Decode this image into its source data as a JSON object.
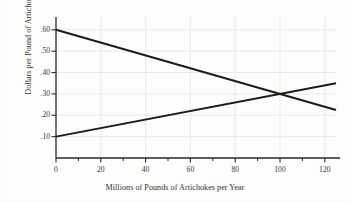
{
  "chart_data": {
    "type": "line",
    "title": "",
    "subtitle": "",
    "xlabel": "Millions of Pounds of Artichokes per Year",
    "ylabel": "Dollars per Pound of Artichokes",
    "xlim": [
      0,
      125
    ],
    "ylim": [
      0,
      0.66
    ],
    "grid": true,
    "legend_position": "none",
    "xticks": [
      0,
      20,
      40,
      60,
      80,
      100,
      120
    ],
    "xticklabels": [
      "0",
      "20",
      "40",
      "60",
      "80",
      "100",
      "120"
    ],
    "xminor_ticks": [
      10,
      30,
      50,
      70,
      90,
      110
    ],
    "yticks": [
      0.1,
      0.2,
      0.3,
      0.4,
      0.5,
      0.6
    ],
    "yticklabels": [
      ".10",
      ".20",
      ".30",
      ".40",
      ".50",
      ".60"
    ],
    "series": [
      {
        "name": "demand",
        "kind": "line",
        "x": [
          0,
          125
        ],
        "y": [
          0.6,
          0.225
        ],
        "color": "#1d1b1b",
        "width": 2.0
      },
      {
        "name": "supply",
        "kind": "line",
        "x": [
          0,
          125
        ],
        "y": [
          0.1,
          0.35
        ],
        "color": "#1d1b1b",
        "width": 2.0
      }
    ],
    "annotations": [
      {
        "name": "equilibrium",
        "x": 98,
        "y": 0.3,
        "label": ""
      }
    ],
    "colors": {
      "background": "#fdfdfc",
      "line": "#1d1b1b",
      "axis": "#2b2828",
      "grid": "#e9e9e7",
      "text": "#333030"
    }
  }
}
